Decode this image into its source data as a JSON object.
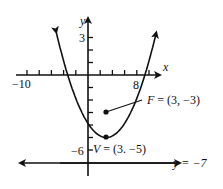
{
  "chart_data": {
    "type": "line",
    "title": "",
    "xlabel": "x",
    "ylabel": "y",
    "x_tick_labels": [
      "-10",
      "8"
    ],
    "y_tick_labels": [
      "3",
      "-6"
    ],
    "xlim": [
      -10,
      10
    ],
    "ylim": [
      -8,
      5
    ],
    "grid": false,
    "equation": "(x-3)^2 = 8(y+5)",
    "series": [
      {
        "name": "parabola",
        "x": [
          -6,
          -5,
          -4,
          -2,
          0,
          1,
          3,
          5,
          6,
          8,
          10,
          11,
          12
        ],
        "y": [
          5.125,
          3.0,
          1.125,
          -1.875,
          -3.875,
          -4.5,
          -5.0,
          -4.5,
          -3.875,
          -1.875,
          1.125,
          3.0,
          5.125
        ]
      }
    ],
    "points": [
      {
        "name": "vertex",
        "label": "V = (3. −5)",
        "x": 3,
        "y": -5
      },
      {
        "name": "focus",
        "label": "F = (3, −3)",
        "x": 3,
        "y": -3
      }
    ],
    "lines": [
      {
        "name": "directrix",
        "label": "y = −7",
        "y": -7
      }
    ]
  },
  "labels": {
    "x_axis": "x",
    "y_axis": "y",
    "x_min": "−10",
    "x_eight": "8",
    "y_three": "3",
    "y_neg_six": "−6",
    "focus": "F = (3, −3)",
    "vertex": "V = (3. −5)",
    "directrix": "y = −7"
  }
}
